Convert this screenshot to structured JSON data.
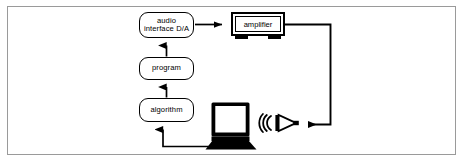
{
  "diagram": {
    "stroke_color": "#000000",
    "frame_color": "#9a9a9a",
    "background": "#ffffff",
    "nodes": [
      {
        "id": "audio_interface",
        "label_line1": "audio",
        "label_line2": "interface D/A",
        "shape": "rounded-rect"
      },
      {
        "id": "program",
        "label": "program",
        "shape": "rounded-rect"
      },
      {
        "id": "algorithm",
        "label": "algorithm",
        "shape": "rounded-rect"
      },
      {
        "id": "amplifier",
        "label": "amplifier",
        "shape": "hardware-box"
      },
      {
        "id": "laptop",
        "label": "laptop",
        "shape": "pictogram"
      },
      {
        "id": "loudspeaker",
        "label": "loudspeaker",
        "shape": "pictogram"
      }
    ],
    "edges": [
      {
        "id": "laptop-to-algorithm",
        "from": "laptop",
        "to": "algorithm",
        "arrow": "up"
      },
      {
        "id": "algorithm-to-program",
        "from": "algorithm",
        "to": "program",
        "arrow": "up"
      },
      {
        "id": "program-to-audio-interface",
        "from": "program",
        "to": "audio_interface",
        "arrow": "up"
      },
      {
        "id": "audio-interface-to-amplifier",
        "from": "audio_interface",
        "to": "amplifier",
        "arrow": "right"
      },
      {
        "id": "amplifier-to-loudspeaker",
        "from": "amplifier",
        "to": "loudspeaker",
        "arrow": "left"
      }
    ]
  }
}
